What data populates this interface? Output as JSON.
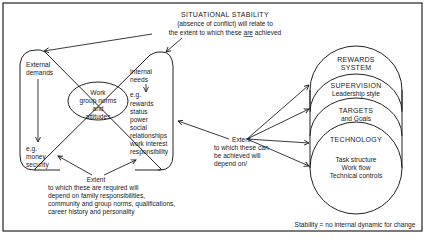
{
  "title": {
    "line1": "SITUATIONAL STABILITY",
    "line2": "(absence of conflict) will relate to",
    "line3_pre": "the extent to which these ",
    "line3_emph": "are",
    "line3_post": " achieved"
  },
  "left_panel": {
    "external": {
      "heading_line1": "External",
      "heading_line2": "demands",
      "example_label": "e.g.",
      "examples": [
        "money",
        "security"
      ]
    },
    "internal": {
      "heading_line1": "Internal",
      "heading_line2": "needs",
      "example_label": "e.g.",
      "examples": [
        "rewards",
        "status",
        "power",
        "social",
        "relationships",
        "work interest",
        "responsibility"
      ]
    },
    "center": {
      "lines": [
        "Work",
        "group norms",
        "and",
        "attitudes"
      ]
    },
    "bottom_note": {
      "heading": "Extent",
      "lines": [
        "to which these are required will",
        "depend on family responsibilities,",
        "community and group norms, qualifications,",
        "career history and personality"
      ]
    }
  },
  "middle_note": {
    "heading": "Extent",
    "lines": [
      "to which these can",
      "be achieved will",
      "depend on/"
    ]
  },
  "factors": [
    {
      "title": "REWARDS",
      "subtitle": "SYSTEM"
    },
    {
      "title": "SUPERVISION",
      "subtitle": "Leadership style"
    },
    {
      "title": "TARGETS",
      "subtitle": "and Goals"
    },
    {
      "title": "TECHNOLOGY",
      "details": [
        "Task structure",
        "Work flow",
        "Technical controls"
      ]
    }
  ],
  "footer": {
    "definition": "Stability = no internal dynamic for change"
  }
}
